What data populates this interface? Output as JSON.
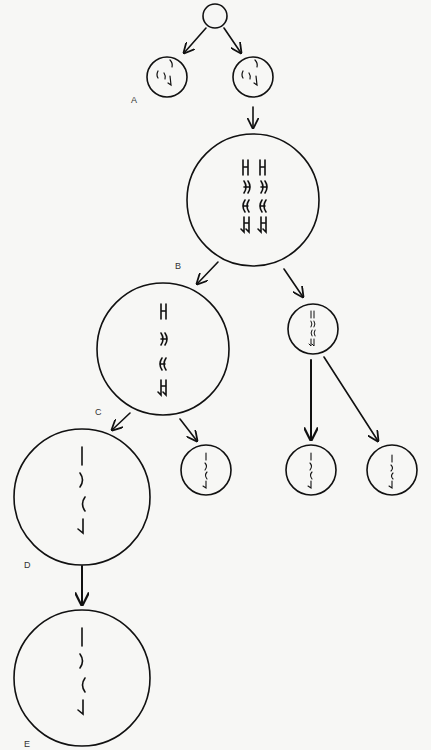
{
  "diagram": {
    "type": "cell-division-flow",
    "colors": {
      "stroke": "#111111",
      "background": "#f7f7f5",
      "label": "#333333"
    },
    "nodes": [
      {
        "id": "origin",
        "label": "",
        "cx": 215,
        "cy": 16,
        "r": 12,
        "chromosomes": "none"
      },
      {
        "id": "A-left",
        "label": "A",
        "cx": 167,
        "cy": 77,
        "r": 20,
        "chromosomes": "3 single squiggles"
      },
      {
        "id": "A-right",
        "label": "",
        "cx": 253,
        "cy": 77,
        "r": 20,
        "chromosomes": "3 single squiggles"
      },
      {
        "id": "B",
        "label": "B",
        "cx": 253,
        "cy": 200,
        "r": 66,
        "chromosomes": "4 pairs of duplicated (H-shaped) chromosomes"
      },
      {
        "id": "C",
        "label": "C",
        "cx": 163,
        "cy": 349,
        "r": 66,
        "chromosomes": "4 duplicated chromosomes"
      },
      {
        "id": "B-polar",
        "label": "",
        "cx": 313,
        "cy": 329,
        "r": 25,
        "chromosomes": "4 small duplicated chromosomes"
      },
      {
        "id": "D",
        "label": "D",
        "cx": 82,
        "cy": 497,
        "r": 68,
        "chromosomes": "4 single chromatids"
      },
      {
        "id": "C-polar",
        "label": "",
        "cx": 206,
        "cy": 470,
        "r": 25,
        "chromosomes": "4 single chromatids"
      },
      {
        "id": "polar-2a",
        "label": "",
        "cx": 311,
        "cy": 470,
        "r": 25,
        "chromosomes": "4 single chromatids"
      },
      {
        "id": "polar-2b",
        "label": "",
        "cx": 392,
        "cy": 470,
        "r": 25,
        "chromosomes": "4 single chromatids"
      },
      {
        "id": "E",
        "label": "E",
        "cx": 82,
        "cy": 678,
        "r": 68,
        "chromosomes": "4 single chromatids"
      }
    ],
    "edges": [
      {
        "from": "origin",
        "to": "A-left"
      },
      {
        "from": "origin",
        "to": "A-right"
      },
      {
        "from": "A-right",
        "to": "B"
      },
      {
        "from": "B",
        "to": "C"
      },
      {
        "from": "B",
        "to": "B-polar"
      },
      {
        "from": "C",
        "to": "D"
      },
      {
        "from": "C",
        "to": "C-polar"
      },
      {
        "from": "B-polar",
        "to": "polar-2a"
      },
      {
        "from": "B-polar",
        "to": "polar-2b"
      },
      {
        "from": "D",
        "to": "E"
      }
    ],
    "labels": {
      "A": "A",
      "B": "B",
      "C": "C",
      "D": "D",
      "E": "E"
    }
  }
}
